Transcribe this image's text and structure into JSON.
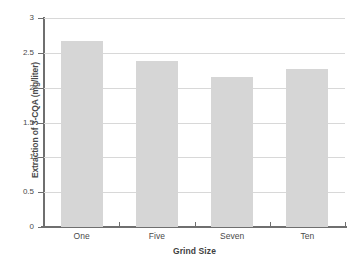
{
  "chart_data": {
    "type": "bar",
    "title": "",
    "subtitle": "",
    "xlabel": "Grind Size",
    "ylabel": "Extraction of 3-CQA (mg/liter)",
    "categories": [
      "One",
      "Five",
      "Seven",
      "Ten"
    ],
    "values": [
      2.67,
      2.38,
      2.15,
      2.27
    ],
    "series": [
      {
        "name": "Extraction of 3-CQA",
        "values": [
          2.67,
          2.38,
          2.15,
          2.27
        ]
      }
    ],
    "ylim": [
      0,
      3
    ],
    "xlim": [
      0,
      4
    ],
    "ytick_labels": [
      "0",
      "0.5",
      "1",
      "1.5",
      "2",
      "2.5",
      "3"
    ],
    "ytick_values": [
      0,
      0.5,
      1,
      1.5,
      2,
      2.5,
      3
    ],
    "grid": "horizontal",
    "legend": "none",
    "annotations": [],
    "bar_color": "#d6d6d6",
    "grid_color": "#d8d8d8",
    "axis_color": "#6f6f6f",
    "text_color": "#4a4a4a",
    "background": "#ffffff"
  }
}
